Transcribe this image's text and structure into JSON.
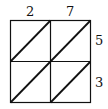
{
  "diagram": {
    "type": "lattice-multiplication-grid",
    "top_digits": [
      "2",
      "7"
    ],
    "right_digits": [
      "5",
      "3"
    ],
    "rows": 2,
    "cols": 2,
    "line_color": "#111111"
  }
}
